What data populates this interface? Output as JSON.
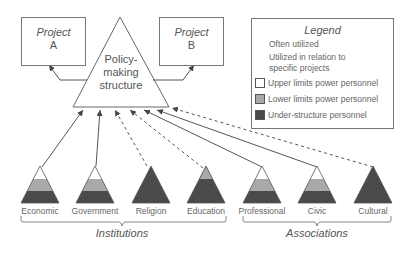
{
  "diagram": {
    "center_node": {
      "label_line1": "Policy-",
      "label_line2": "making",
      "label_line3": "structure"
    },
    "projects": [
      {
        "line1": "Project",
        "line2": "A"
      },
      {
        "line1": "Project",
        "line2": "B"
      }
    ],
    "legend": {
      "title": "Legend",
      "items": [
        {
          "symbol": "solid-line",
          "label": "Often utilized"
        },
        {
          "symbol": "dashed-line",
          "label_line1": "Utilized in relation to",
          "label_line2": "specific projects"
        },
        {
          "symbol": "swatch",
          "color": "#ffffff",
          "label": "Upper limits power personnel"
        },
        {
          "symbol": "swatch",
          "color": "#a9a9a9",
          "label": "Lower limits power personnel"
        },
        {
          "symbol": "swatch",
          "color": "#4a4a4a",
          "label": "Under-structure personnel"
        }
      ]
    },
    "organizations": [
      {
        "label": "Economic",
        "tiers": "three",
        "link": "solid"
      },
      {
        "label": "Government",
        "tiers": "three",
        "link": "solid"
      },
      {
        "label": "Religion",
        "tiers": "under-only",
        "link": "dashed"
      },
      {
        "label": "Education",
        "tiers": "lower-under",
        "link": "dashed"
      },
      {
        "label": "Professional",
        "tiers": "three",
        "link": "solid"
      },
      {
        "label": "Civic",
        "tiers": "three",
        "link": "solid"
      },
      {
        "label": "Cultural",
        "tiers": "under-only",
        "link": "dashed"
      }
    ],
    "groups": [
      {
        "label": "Institutions"
      },
      {
        "label": "Associations"
      }
    ],
    "colors": {
      "upper": "#ffffff",
      "lower": "#a9a9a9",
      "under": "#4a4a4a",
      "line": "#555555"
    }
  }
}
